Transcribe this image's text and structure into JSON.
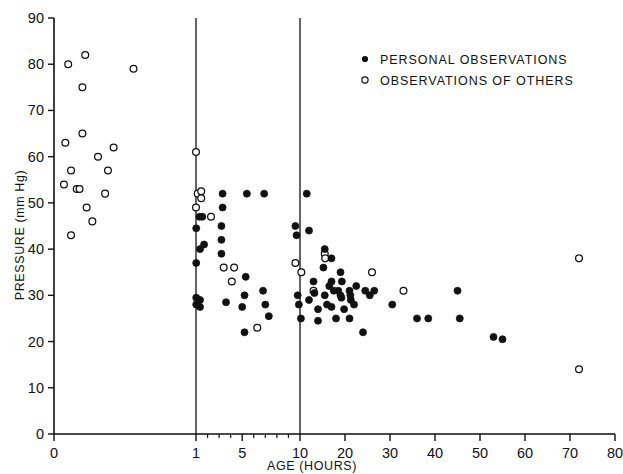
{
  "figure": {
    "background": "#ffffff",
    "ink_color": "#111111"
  },
  "legend": {
    "position": "top-right",
    "entries": [
      {
        "marker": "filled-circle-icon",
        "label": "PERSONAL OBSERVATIONS",
        "filled": true
      },
      {
        "marker": "open-circle-icon",
        "label": "OBSERVATIONS OF OTHERS",
        "filled": false
      }
    ]
  },
  "chart_data": {
    "type": "scatter",
    "title": "",
    "xlabel": "AGE (HOURS)",
    "ylabel": "PRESSURE (mm Hg)",
    "xscale": "piecewise: 0-1 expanded, 1-10 compressed, 10-80 linear",
    "yscale": "linear",
    "xlim": [
      0,
      80
    ],
    "ylim": [
      0,
      90
    ],
    "grid": false,
    "x_tick_labels": [
      "0",
      "1",
      "5",
      "10",
      "20",
      "30",
      "40",
      "50",
      "60",
      "70",
      "80"
    ],
    "x_tick_values": [
      0,
      1,
      5,
      10,
      20,
      30,
      40,
      50,
      60,
      70,
      80
    ],
    "x_minor_ticks": [
      2,
      3,
      4,
      6,
      7,
      8,
      9
    ],
    "y_tick_labels": [
      "0",
      "10",
      "20",
      "30",
      "40",
      "50",
      "60",
      "70",
      "80",
      "90"
    ],
    "y_tick_values": [
      0,
      10,
      20,
      30,
      40,
      50,
      60,
      70,
      80,
      90
    ],
    "dividers": [
      1,
      10
    ],
    "series": [
      {
        "name": "OBSERVATIONS OF OTHERS",
        "marker": "open-circle",
        "points": [
          [
            0.1,
            80
          ],
          [
            0.22,
            82
          ],
          [
            0.2,
            75
          ],
          [
            0.56,
            79
          ],
          [
            0.08,
            63
          ],
          [
            0.2,
            65
          ],
          [
            0.31,
            60
          ],
          [
            0.42,
            62
          ],
          [
            0.12,
            57
          ],
          [
            0.38,
            57
          ],
          [
            0.07,
            54
          ],
          [
            0.16,
            53
          ],
          [
            0.18,
            53
          ],
          [
            0.36,
            52
          ],
          [
            0.23,
            49
          ],
          [
            0.27,
            46
          ],
          [
            0.12,
            43
          ],
          [
            1.0,
            61
          ],
          [
            1.0,
            49
          ],
          [
            1.15,
            52
          ],
          [
            1.45,
            52.5
          ],
          [
            1.45,
            51
          ],
          [
            2.3,
            47
          ],
          [
            3.4,
            36
          ],
          [
            4.3,
            36
          ],
          [
            4.1,
            33
          ],
          [
            6.3,
            23
          ],
          [
            9.6,
            37
          ],
          [
            10.3,
            35
          ],
          [
            15.5,
            39
          ],
          [
            15.6,
            38
          ],
          [
            13.0,
            31
          ],
          [
            26.0,
            35
          ],
          [
            33.0,
            31
          ],
          [
            72.0,
            38
          ],
          [
            72.0,
            14
          ]
        ]
      },
      {
        "name": "PERSONAL OBSERVATIONS",
        "marker": "filled-circle",
        "points": [
          [
            1.02,
            44.5
          ],
          [
            1.02,
            37
          ],
          [
            1.02,
            29.5
          ],
          [
            1.02,
            28
          ],
          [
            1.3,
            47
          ],
          [
            1.55,
            47
          ],
          [
            1.35,
            40
          ],
          [
            1.7,
            41
          ],
          [
            1.35,
            29
          ],
          [
            1.35,
            27.5
          ],
          [
            3.3,
            52
          ],
          [
            3.3,
            49
          ],
          [
            3.2,
            45
          ],
          [
            3.2,
            42
          ],
          [
            3.2,
            39
          ],
          [
            3.6,
            28.5
          ],
          [
            5.4,
            52
          ],
          [
            6.9,
            52
          ],
          [
            5.3,
            34
          ],
          [
            5.2,
            30
          ],
          [
            5.0,
            27.5
          ],
          [
            5.2,
            22
          ],
          [
            6.8,
            31
          ],
          [
            7.0,
            28
          ],
          [
            7.3,
            25.5
          ],
          [
            9.8,
            30
          ],
          [
            9.9,
            28
          ],
          [
            10.2,
            25
          ],
          [
            9.6,
            45
          ],
          [
            9.7,
            43
          ],
          [
            11.5,
            52
          ],
          [
            12.0,
            44
          ],
          [
            15.5,
            40
          ],
          [
            17.0,
            38
          ],
          [
            15.2,
            36
          ],
          [
            19.0,
            35
          ],
          [
            19.3,
            33
          ],
          [
            13.0,
            33
          ],
          [
            13.2,
            30.5
          ],
          [
            12.0,
            29
          ],
          [
            16.5,
            32
          ],
          [
            17.5,
            31
          ],
          [
            15.5,
            30
          ],
          [
            18.5,
            31
          ],
          [
            19.0,
            30
          ],
          [
            19.2,
            29.5
          ],
          [
            21.0,
            31
          ],
          [
            21.2,
            30
          ],
          [
            21.3,
            29
          ],
          [
            17.0,
            33
          ],
          [
            14.0,
            27
          ],
          [
            16.0,
            28
          ],
          [
            22.5,
            32
          ],
          [
            24.5,
            31
          ],
          [
            22.0,
            28
          ],
          [
            19.8,
            27
          ],
          [
            17.0,
            27.5
          ],
          [
            25.5,
            30
          ],
          [
            26.5,
            31
          ],
          [
            14.0,
            24.5
          ],
          [
            18.0,
            25
          ],
          [
            21.0,
            25
          ],
          [
            24.0,
            22
          ],
          [
            30.5,
            28
          ],
          [
            36.0,
            25
          ],
          [
            38.5,
            25
          ],
          [
            45.0,
            31
          ],
          [
            45.5,
            25
          ],
          [
            53.0,
            21
          ],
          [
            55.0,
            20.5
          ]
        ]
      }
    ]
  }
}
